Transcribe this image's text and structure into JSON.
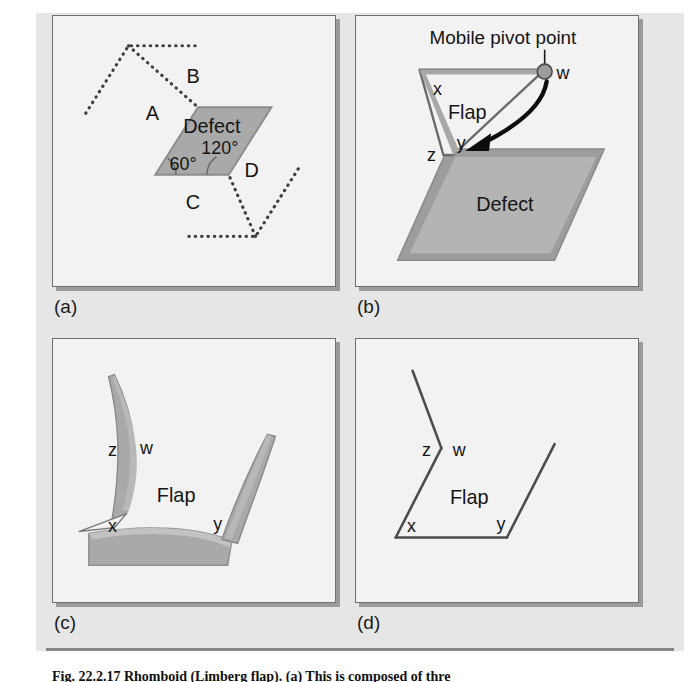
{
  "figure": {
    "caption": "Fig. 22.2.17 Rhomboid (Limberg flap). (a) This is composed of thre",
    "panels": [
      {
        "id": "a",
        "label": "(a)",
        "labels": {
          "defect": "Defect",
          "angle_acute": "60°",
          "angle_obtuse": "120°",
          "flap_a": "A",
          "flap_b": "B",
          "flap_c": "C",
          "flap_d": "D"
        }
      },
      {
        "id": "b",
        "label": "(b)",
        "labels": {
          "pivot_callout": "Mobile pivot point",
          "vertex_w": "w",
          "vertex_x": "x",
          "vertex_y": "y",
          "vertex_z": "z",
          "flap": "Flap",
          "defect": "Defect"
        }
      },
      {
        "id": "c",
        "label": "(c)",
        "labels": {
          "vertex_w": "w",
          "vertex_x": "x",
          "vertex_y": "y",
          "vertex_z": "z",
          "flap": "Flap"
        }
      },
      {
        "id": "d",
        "label": "(d)",
        "labels": {
          "vertex_w": "w",
          "vertex_x": "x",
          "vertex_y": "y",
          "vertex_z": "z",
          "flap": "Flap"
        }
      }
    ]
  },
  "colors": {
    "page_background": "#ffffff",
    "plate_background": "#e6e6e6",
    "panel_background": "#f2f2f2",
    "panel_border": "#6f6f6f",
    "panel_shadow": "#8a8a8a",
    "defect_fill": "#a9a9a9",
    "defect_fill_light": "#b3b3b3",
    "defect_edge": "#8d8d8d",
    "outline_stroke": "#5a5a5a",
    "dotted_stroke": "#4a4a4a",
    "arrow_black": "#0d0d0d",
    "pivot_dot": "#9c9c9c",
    "text": "#141414"
  }
}
